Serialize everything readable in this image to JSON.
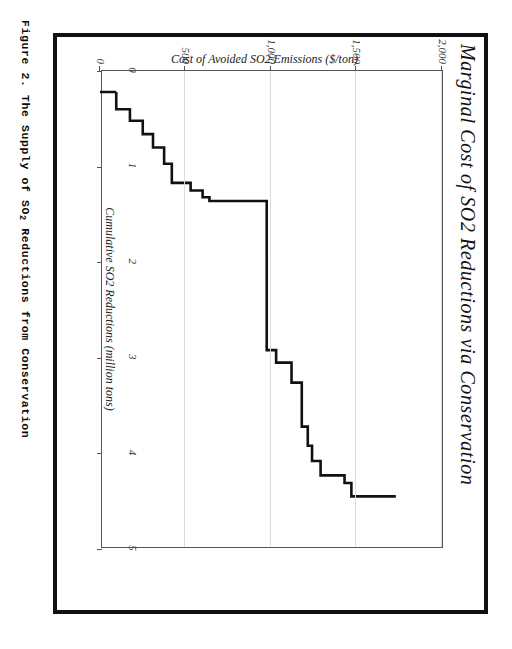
{
  "page": {
    "caption": "Figure 2.  The Supply of SO",
    "caption_sub": "2",
    "caption_tail": " Reductions from Conservation",
    "frame_color": "#111111"
  },
  "chart_data": {
    "type": "line",
    "subtype": "step",
    "title": "Marginal Cost of SO2 Reductions via Conservation",
    "xlabel": "Cumulative SO2 Reductions (million tons)",
    "ylabel": "Cost of Avoided SO2 Emissions ($/ton)",
    "xlim": [
      0,
      5
    ],
    "ylim": [
      0,
      2000
    ],
    "xticks": [
      0,
      1,
      2,
      3,
      4,
      5
    ],
    "xticklabels": [
      "0",
      "1",
      "2",
      "3",
      "4",
      "5"
    ],
    "yticks": [
      0,
      500,
      1000,
      1500,
      2000
    ],
    "yticklabels": [
      "0",
      "500",
      "1,000",
      "1,500",
      "2,000"
    ],
    "grid": "y-only",
    "legend": "none",
    "line_color": "#111111",
    "line_width": 2.6,
    "steps_x": [
      0.22,
      0.22,
      0.4,
      0.4,
      0.52,
      0.52,
      0.66,
      0.66,
      0.8,
      0.8,
      0.97,
      0.97,
      1.17,
      1.17,
      1.25,
      1.25,
      1.32,
      1.32,
      1.36,
      1.36,
      2.92,
      2.92,
      3.05,
      3.05,
      3.26,
      3.26,
      3.72,
      3.72,
      3.92,
      3.92,
      4.08,
      4.08,
      4.23,
      4.23,
      4.31,
      4.31,
      4.45
    ],
    "steps_y": [
      95,
      175,
      175,
      250,
      250,
      310,
      310,
      375,
      375,
      420,
      420,
      530,
      530,
      600,
      600,
      640,
      640,
      975,
      975,
      1030,
      1030,
      1120,
      1120,
      1180,
      1180,
      1215,
      1215,
      1240,
      1240,
      1290,
      1290,
      1430,
      1430,
      1470,
      1470,
      1730,
      1730
    ],
    "series": [
      {
        "name": "Marginal cost supply curve",
        "points": [
          {
            "x": 0.22,
            "y": 95
          },
          {
            "x": 0.4,
            "y": 175
          },
          {
            "x": 0.52,
            "y": 250
          },
          {
            "x": 0.66,
            "y": 310
          },
          {
            "x": 0.8,
            "y": 375
          },
          {
            "x": 0.97,
            "y": 420
          },
          {
            "x": 1.17,
            "y": 530
          },
          {
            "x": 1.25,
            "y": 600
          },
          {
            "x": 1.32,
            "y": 640
          },
          {
            "x": 1.36,
            "y": 975
          },
          {
            "x": 2.92,
            "y": 1030
          },
          {
            "x": 3.05,
            "y": 1120
          },
          {
            "x": 3.26,
            "y": 1180
          },
          {
            "x": 3.72,
            "y": 1215
          },
          {
            "x": 3.92,
            "y": 1240
          },
          {
            "x": 4.08,
            "y": 1290
          },
          {
            "x": 4.23,
            "y": 1430
          },
          {
            "x": 4.31,
            "y": 1470
          },
          {
            "x": 4.45,
            "y": 1730
          }
        ]
      }
    ]
  }
}
